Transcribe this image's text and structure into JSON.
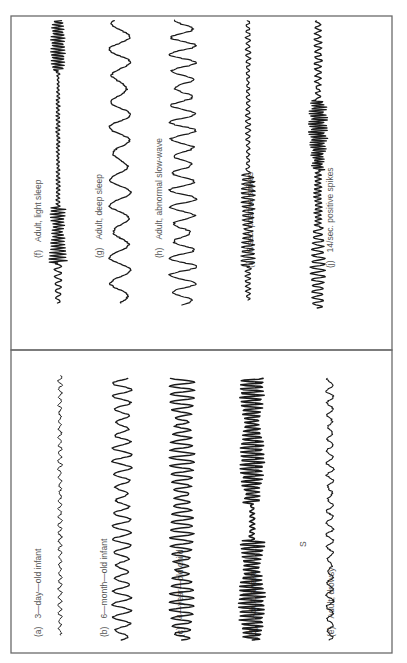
{
  "figure": {
    "orientation": "rotated-90-ccw",
    "colors": {
      "frame": "#6a6a6a",
      "trace": "#1a1a1a",
      "label": "#555555",
      "background": "#ffffff"
    },
    "panels": [
      {
        "id": "upper",
        "traces": [
          {
            "letter": "(f)",
            "label": "Adult, light sleep",
            "style": "light-sleep"
          },
          {
            "letter": "(g)",
            "label": "Adult, deep sleep",
            "style": "deep-sleep"
          },
          {
            "letter": "(h)",
            "label": "Adult, abnormal slow-wave",
            "style": "slow-wave"
          },
          {
            "letter": "(i)",
            "label": "6/sec. positive spikes",
            "style": "6hz-spikes"
          },
          {
            "letter": "(j)",
            "label": "14/sec. positive spikes",
            "style": "14hz-spikes"
          }
        ]
      },
      {
        "id": "lower",
        "traces": [
          {
            "letter": "(a)",
            "label": "3—day—old infant",
            "style": "newborn"
          },
          {
            "letter": "(b)",
            "label": "6—month—old  infant",
            "style": "infant"
          },
          {
            "letter": "(c)",
            "label": "4—year—old child",
            "style": "child"
          },
          {
            "letter": "(d)",
            "label": "Adult, awake",
            "style": "awake"
          },
          {
            "letter": "(e)",
            "label": "Adult, drowsy",
            "style": "drowsy"
          }
        ],
        "marker": "S"
      }
    ]
  }
}
